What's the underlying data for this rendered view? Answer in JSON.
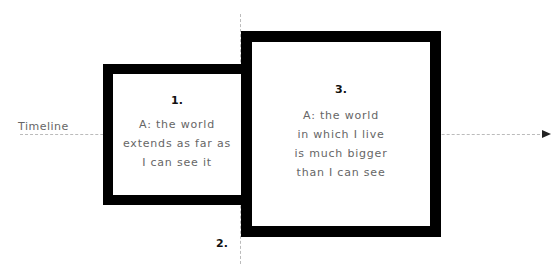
{
  "timeline": {
    "label": "Timeline"
  },
  "boxes": [
    {
      "number": "1.",
      "text": "A: the world\nextends as far as\nI can see it"
    },
    {
      "number": "3.",
      "text": "A: the world\nin which I live\nis much bigger\nthan I can see"
    }
  ],
  "marker": {
    "label": "2."
  },
  "colors": {
    "border": "#000000",
    "text": "#666666",
    "line": "#bbbbbb"
  }
}
